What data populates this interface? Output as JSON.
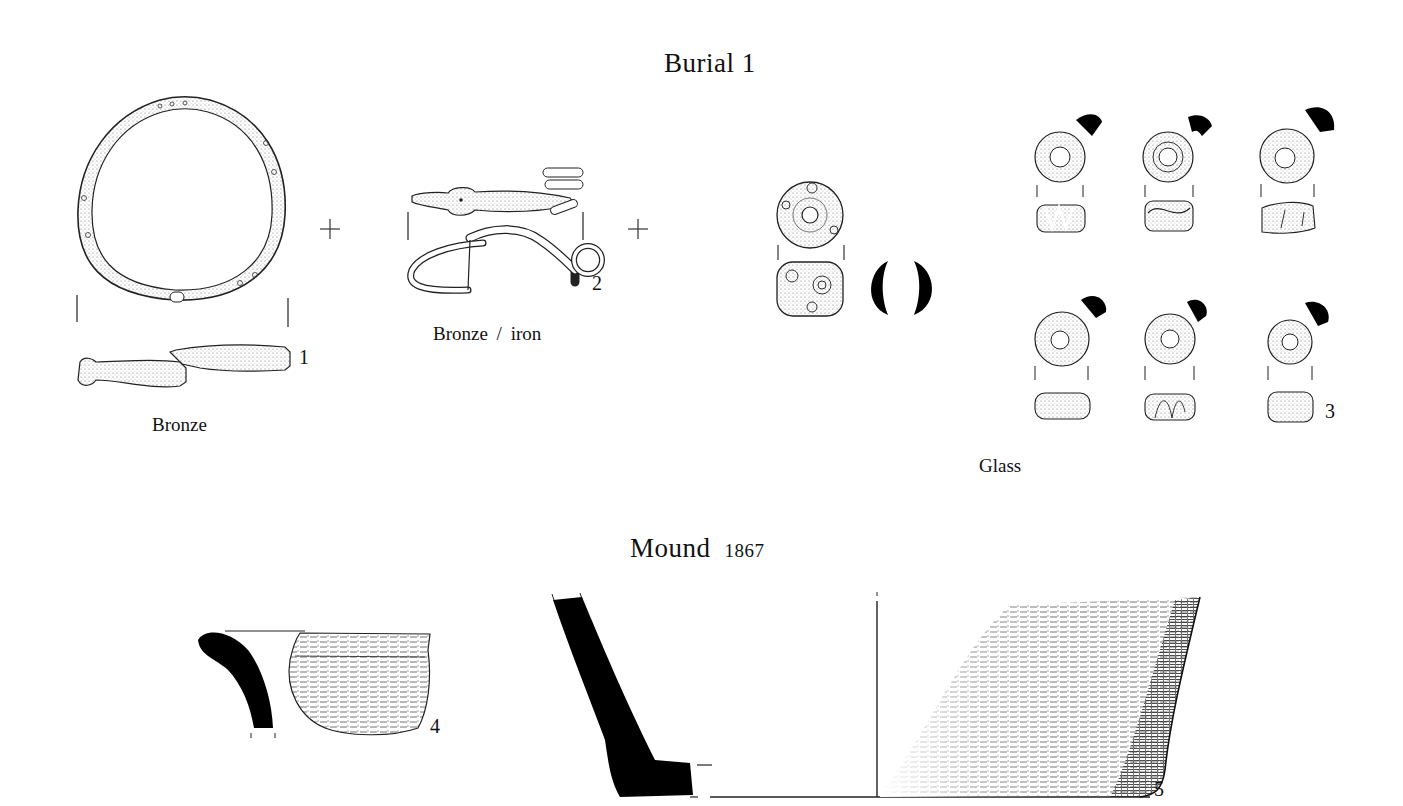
{
  "plate": {
    "section_1": {
      "title": "Burial 1",
      "items": [
        {
          "number": "1",
          "material": "Bronze",
          "object": "bracelet / armlet"
        },
        {
          "number": "2",
          "material": "Bronze / iron",
          "object": "brooch"
        },
        {
          "number": "3",
          "material": "Glass",
          "object": "beads"
        }
      ],
      "plus_signs": [
        "+",
        "+"
      ]
    },
    "section_2": {
      "title": "Mound",
      "year": "1867",
      "items": [
        {
          "number": "4",
          "object": "pottery rim sherd"
        },
        {
          "number": "5",
          "object": "pottery base sherd"
        }
      ]
    }
  },
  "colors": {
    "ink": "#111111",
    "background": "#ffffff",
    "section_fill": "#000000"
  }
}
